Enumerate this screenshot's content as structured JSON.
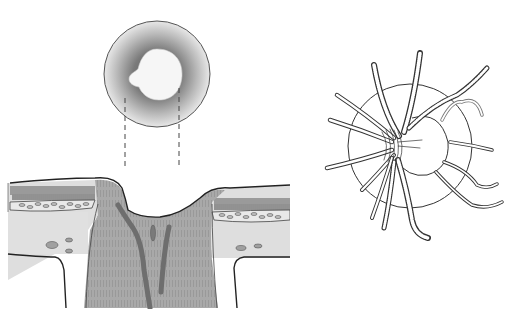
{
  "figure": {
    "type": "anatomical-illustration",
    "panels": [
      {
        "id": "fundus-disc-view",
        "description": "en face view of optic disc with central cup, shaded rim"
      },
      {
        "id": "cross-section-view",
        "description": "sagittal section through optic nerve head showing retinal layers, cup and central vessels"
      },
      {
        "id": "vessel-view",
        "description": "retinal arteries and veins radiating from the optic disc"
      }
    ],
    "projection_lines": 2,
    "text_labels": []
  },
  "colors": {
    "background": "#ffffff",
    "outline": "#2a2a2a",
    "nerve_tissue": "#a8a8a8",
    "retina_fill": "#dcdcdc",
    "vessel_fill": "#777777",
    "cup_fill": "#f4f4f4",
    "rim_dark": "#6a6a6a"
  }
}
